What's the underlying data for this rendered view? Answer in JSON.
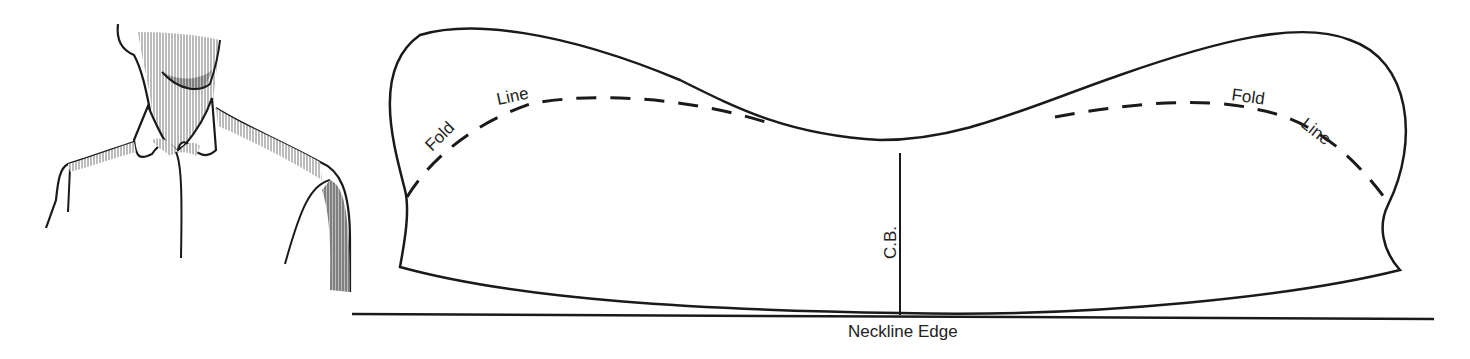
{
  "figure": {
    "illustration": {
      "subject": "shirt-collar-figure"
    },
    "pattern": {
      "labels": {
        "fold_left": "Fold",
        "line_left": "Line",
        "fold_right": "Fold",
        "line_right": "Line",
        "center_back": "C.B.",
        "neckline": "Neckline Edge"
      }
    },
    "colors": {
      "ink": "#1a1a1a",
      "background": "#ffffff",
      "hatch": "#8a8a8a"
    }
  }
}
